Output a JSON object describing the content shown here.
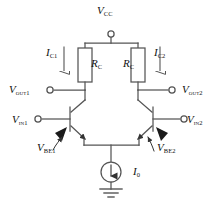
{
  "diagram": {
    "type": "circuit-schematic",
    "background_color": "#ffffff",
    "line_color": "#555555",
    "text_color": "#111111"
  },
  "labels": {
    "supply": {
      "symbol": "V",
      "sub": "CC",
      "name": "supply-voltage"
    },
    "collector_current_left": {
      "symbol": "I",
      "sub": "C1",
      "name": "collector-current-1"
    },
    "collector_current_right": {
      "symbol": "I",
      "sub": "C2",
      "name": "collector-current-2"
    },
    "resistor_left": {
      "symbol": "R",
      "sub": "C",
      "name": "collector-resistor-left"
    },
    "resistor_right": {
      "symbol": "R",
      "sub": "C",
      "name": "collector-resistor-right"
    },
    "output_left": {
      "symbol": "V",
      "sub": "out1",
      "name": "output-1"
    },
    "output_right": {
      "symbol": "V",
      "sub": "out2",
      "name": "output-2"
    },
    "input_left": {
      "symbol": "V",
      "sub": "in1",
      "name": "input-1"
    },
    "input_right": {
      "symbol": "V",
      "sub": "in2",
      "name": "input-2"
    },
    "vbe_left": {
      "symbol": "V",
      "sub": "BE1",
      "name": "base-emitter-voltage-1"
    },
    "vbe_right": {
      "symbol": "V",
      "sub": "BE2",
      "name": "base-emitter-voltage-2"
    },
    "tail_current": {
      "symbol": "I",
      "sub": "0",
      "name": "tail-current-source"
    }
  },
  "nodes": {
    "vcc_terminal": {
      "x": 111,
      "y": 33
    },
    "vout1_terminal": {
      "x": 50,
      "y": 90
    },
    "vout2_terminal": {
      "x": 172,
      "y": 90
    },
    "vin1_terminal": {
      "x": 38,
      "y": 120
    },
    "vin2_terminal": {
      "x": 184,
      "y": 120
    }
  },
  "components": [
    {
      "name": "collector-resistor-left",
      "kind": "resistor",
      "x": 78,
      "y": 48,
      "w": 14,
      "h": 34
    },
    {
      "name": "collector-resistor-right",
      "kind": "resistor",
      "x": 131,
      "y": 48,
      "w": 14,
      "h": 34
    },
    {
      "name": "transistor-q1",
      "kind": "npn-bjt",
      "x": 62,
      "y": 105
    },
    {
      "name": "transistor-q2",
      "kind": "npn-bjt",
      "x": 160,
      "y": 105
    },
    {
      "name": "current-source",
      "kind": "current-source",
      "x": 111,
      "y": 172,
      "r": 10
    },
    {
      "name": "ground",
      "kind": "ground",
      "x": 111,
      "y": 190
    }
  ]
}
